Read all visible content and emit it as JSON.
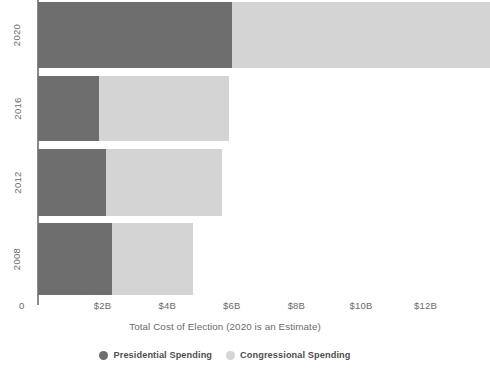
{
  "chart_data": {
    "type": "bar",
    "orientation": "horizontal",
    "stacked": true,
    "title": "",
    "xlabel": "Total Cost of Election (2020 is an Estimate)",
    "ylabel": "",
    "categories": [
      "2020",
      "2016",
      "2012",
      "2008"
    ],
    "series": [
      {
        "name": "Presidential Spending",
        "color": "#6e6e6e",
        "values": [
          6.0,
          1.9,
          2.1,
          2.3
        ]
      },
      {
        "name": "Congressional Spending",
        "color": "#d4d4d4",
        "values": [
          8.0,
          4.0,
          3.6,
          2.5
        ]
      }
    ],
    "totals": [
      14.0,
      5.9,
      5.7,
      4.8
    ],
    "xlim": [
      0,
      12.75
    ],
    "xticks": [
      0,
      2,
      4,
      6,
      8,
      10,
      12
    ],
    "xticklabels": [
      "0",
      "$2B",
      "$4B",
      "$6B",
      "$8B",
      "$10B",
      "$12B"
    ],
    "grid": false,
    "legend_position": "bottom"
  },
  "axis": {
    "zero_label": "0",
    "x_title": "Total Cost of Election (2020 is an Estimate)",
    "ticks": [
      "$2B",
      "$4B",
      "$6B",
      "$8B",
      "$10B",
      "$12B"
    ],
    "year_labels": [
      "2020",
      "2016",
      "2012",
      "2008"
    ]
  },
  "legend": {
    "items": [
      {
        "label": "Presidential Spending",
        "marker": "circle-marker-dark"
      },
      {
        "label": "Congressional Spending",
        "marker": "circle-marker-light"
      }
    ]
  },
  "colors": {
    "presidential": "#6e6e6e",
    "congressional": "#d4d4d4",
    "axis": "#8a8a8a",
    "text": "#6b6b6b"
  }
}
